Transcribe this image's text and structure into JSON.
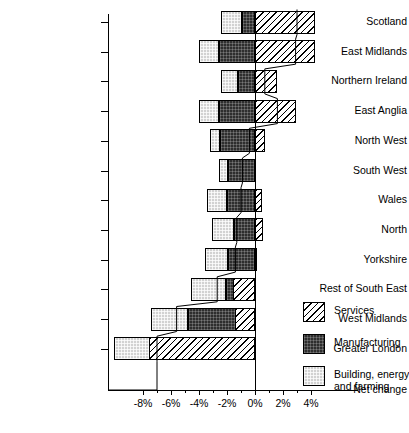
{
  "chart_data": {
    "type": "bar",
    "orientation": "horizontal",
    "stacked": true,
    "title": "",
    "subtitle": "",
    "xlabel": "",
    "ylabel": "",
    "xlim": [
      -8,
      4
    ],
    "grid": false,
    "legend_position": "right",
    "categories": [
      "Scotland",
      "East Midlands",
      "Northern Ireland",
      "East Anglia",
      "North West",
      "South West",
      "Wales",
      "North",
      "Yorkshire",
      "Rest of South East",
      "West Midlands",
      "Greater London"
    ],
    "series": [
      {
        "name": "Building, energy and farming",
        "values": [
          -2.4,
          -4.0,
          -2.4,
          -4.0,
          -3.2,
          -2.6,
          -3.4,
          -3.1,
          -3.6,
          -4.6,
          -7.4,
          -10.1
        ]
      },
      {
        "name": "Manufacturing",
        "values": [
          -0.9,
          -2.6,
          -1.2,
          -2.6,
          -2.5,
          -1.9,
          -2.0,
          -1.5,
          -1.9,
          -2.1,
          -4.8,
          -1.9
        ]
      },
      {
        "name": "Services",
        "values": [
          4.3,
          4.3,
          1.6,
          2.9,
          0.7,
          0.0,
          0.5,
          0.6,
          0.1,
          -1.6,
          -1.4,
          -7.6
        ]
      }
    ],
    "net_change": [
      3.0,
      2.9,
      0.7,
      1.6,
      -0.4,
      -0.9,
      -1.0,
      -1.3,
      -1.4,
      -2.7,
      -5.6,
      -7.0
    ],
    "xticks": [
      -8,
      -6,
      -4,
      -2,
      0,
      2,
      4
    ],
    "xticklabels": [
      "-8%",
      "-6%",
      "-4%",
      "-2%",
      "0%",
      "2%",
      "4%"
    ],
    "net_change_label": "Net change",
    "legend": [
      {
        "label": "Services",
        "pattern": "diagonal-hatch"
      },
      {
        "label": "Manufacturing",
        "pattern": "dark-dotted"
      },
      {
        "label": "Building, energy and farming",
        "pattern": "light-dotted"
      }
    ],
    "colors": {
      "services": "#ffffff",
      "manufacturing": "#2e2e2e",
      "building": "#d2d2d2",
      "axis": "#000000",
      "net_change_line": "#000000"
    }
  }
}
